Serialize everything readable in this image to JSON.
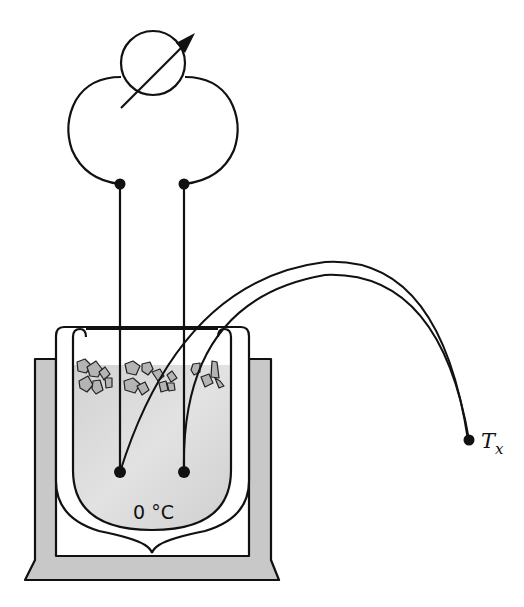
{
  "diagram": {
    "labels": {
      "reference_temp": "0 °C",
      "measuring_junction_symbol": "T",
      "measuring_junction_subscript": "x"
    },
    "components": [
      {
        "id": "meter",
        "name": "Voltmeter (variable indicator symbol)"
      },
      {
        "id": "left-lead",
        "name": "Left circuit loop"
      },
      {
        "id": "right-lead",
        "name": "Right circuit loop"
      },
      {
        "id": "reference-junction-left",
        "name": "Reference junction (left)"
      },
      {
        "id": "reference-junction-right",
        "name": "Reference junction (right)"
      },
      {
        "id": "dewar-flask",
        "name": "Dewar flask"
      },
      {
        "id": "ice-water",
        "name": "Ice-water mixture"
      },
      {
        "id": "flask-stand",
        "name": "Insulating stand"
      },
      {
        "id": "thermocouple-wires",
        "name": "Thermocouple wires"
      },
      {
        "id": "measuring-junction",
        "name": "Measuring junction at T_x"
      }
    ],
    "colors": {
      "line": "#111111",
      "stand_fill": "#c8c8c8",
      "liquid_fill": "#d9d9d9",
      "ice_fill": "#b4b4b4",
      "background": "#ffffff"
    }
  }
}
